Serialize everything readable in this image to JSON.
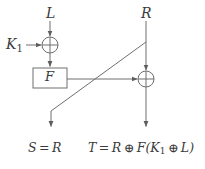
{
  "diagram": {
    "type": "block-flow-diagram",
    "colors": {
      "line": "#6e6e6e",
      "text": "#3a3a3a",
      "background": "#ffffff"
    },
    "labels": {
      "input_left": "L",
      "input_right": "R",
      "key": "K",
      "key_subscript": "1",
      "function_box": "F"
    },
    "outputs": {
      "left_equation": "S = R",
      "right_equation": "T = R ⊕ F(K₁ ⊕ L)",
      "left_equation_parts": {
        "lhs": "S",
        "eq": "=",
        "rhs": "R"
      },
      "right_equation_parts": {
        "lhs": "T",
        "eq": "=",
        "term1": "R",
        "xor1": "⊕",
        "fn": "F(",
        "key": "K",
        "key_sub": "1",
        "xor2": "⊕",
        "term2": "L",
        "close": ")"
      }
    },
    "nodes": [
      {
        "name": "xor-left",
        "kind": "xor-gate",
        "cx": 50,
        "cy": 45,
        "r": 8,
        "symbol": "⊕"
      },
      {
        "name": "xor-right",
        "kind": "xor-gate",
        "cx": 146,
        "cy": 79,
        "r": 8,
        "symbol": "⊕"
      },
      {
        "name": "f-box",
        "kind": "process-box",
        "x": 33,
        "y": 68,
        "w": 34,
        "h": 20,
        "label": "F"
      }
    ],
    "edges": [
      {
        "name": "L-into-xor-left",
        "from": "L",
        "to": "xor-left",
        "arrow": true
      },
      {
        "name": "K1-into-xor-left",
        "from": "K1",
        "to": "xor-left",
        "arrow": true
      },
      {
        "name": "xor-left-into-f",
        "from": "xor-left",
        "to": "f-box",
        "arrow": true
      },
      {
        "name": "f-into-xor-right",
        "from": "f-box",
        "to": "xor-right",
        "arrow": true
      },
      {
        "name": "R-into-xor-right",
        "from": "R",
        "to": "xor-right",
        "arrow": true
      },
      {
        "name": "R-crossover-to-S",
        "from": "R",
        "to": "S",
        "arrow": true
      },
      {
        "name": "xor-right-to-T",
        "from": "xor-right",
        "to": "T",
        "arrow": true
      }
    ]
  }
}
